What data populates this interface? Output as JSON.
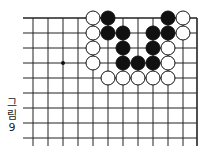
{
  "diagram": {
    "caption_chars": [
      "그",
      "림",
      "9"
    ],
    "grid": {
      "cols_x": [
        33,
        48,
        63,
        78,
        93,
        108,
        123,
        138,
        153,
        168,
        183,
        197
      ],
      "rows_y": [
        18,
        33,
        48,
        63,
        78,
        93,
        108,
        123,
        138
      ],
      "top_edge": true,
      "right_edge": true,
      "line_color": "#222222"
    },
    "star_points": [
      [
        2,
        3
      ]
    ],
    "stone_radius": 7,
    "stones": [
      {
        "color": "white",
        "col": 4,
        "row": 0
      },
      {
        "color": "black",
        "col": 5,
        "row": 0
      },
      {
        "color": "black",
        "col": 9,
        "row": 0
      },
      {
        "color": "white",
        "col": 10,
        "row": 0
      },
      {
        "color": "white",
        "col": 4,
        "row": 1
      },
      {
        "color": "black",
        "col": 5,
        "row": 1
      },
      {
        "color": "black",
        "col": 6,
        "row": 1
      },
      {
        "color": "black",
        "col": 8,
        "row": 1
      },
      {
        "color": "black",
        "col": 9,
        "row": 1
      },
      {
        "color": "white",
        "col": 10,
        "row": 1
      },
      {
        "color": "white",
        "col": 4,
        "row": 2
      },
      {
        "color": "black",
        "col": 6,
        "row": 2
      },
      {
        "color": "black",
        "col": 8,
        "row": 2
      },
      {
        "color": "white",
        "col": 9,
        "row": 2
      },
      {
        "color": "white",
        "col": 4,
        "row": 3
      },
      {
        "color": "black",
        "col": 6,
        "row": 3
      },
      {
        "color": "black",
        "col": 7,
        "row": 3
      },
      {
        "color": "black",
        "col": 8,
        "row": 3
      },
      {
        "color": "white",
        "col": 9,
        "row": 3
      },
      {
        "color": "white",
        "col": 5,
        "row": 4
      },
      {
        "color": "white",
        "col": 6,
        "row": 4
      },
      {
        "color": "white",
        "col": 7,
        "row": 4
      },
      {
        "color": "white",
        "col": 8,
        "row": 4
      },
      {
        "color": "white",
        "col": 9,
        "row": 4
      }
    ]
  }
}
